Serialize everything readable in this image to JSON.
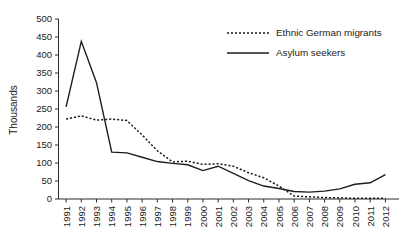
{
  "chart_data": {
    "type": "line",
    "title": "",
    "xlabel": "",
    "ylabel": "Thousands",
    "ylim": [
      0,
      500
    ],
    "ytick_step": 50,
    "yticks": [
      "0",
      "50",
      "100",
      "150",
      "200",
      "250",
      "300",
      "350",
      "400",
      "450",
      "500"
    ],
    "grid": false,
    "legend_position": "top-right",
    "categories": [
      "1991",
      "1992",
      "1993",
      "1994",
      "1995",
      "1996",
      "1997",
      "1998",
      "1999",
      "2000",
      "2001",
      "2002",
      "2003",
      "2004",
      "2005",
      "2006",
      "2007",
      "2008",
      "2009",
      "2010",
      "2011",
      "2012"
    ],
    "series": [
      {
        "name": "Ethnic German migrants",
        "style": "dotted",
        "values": [
          222,
          231,
          219,
          222,
          218,
          178,
          134,
          103,
          105,
          96,
          98,
          91,
          73,
          59,
          36,
          8,
          6,
          4,
          3,
          2,
          2,
          2
        ]
      },
      {
        "name": "Asylum seekers",
        "style": "solid",
        "values": [
          256,
          438,
          323,
          130,
          128,
          116,
          104,
          99,
          95,
          79,
          91,
          71,
          51,
          36,
          29,
          21,
          19,
          22,
          28,
          41,
          45,
          68
        ]
      }
    ]
  },
  "legend": {
    "entries": [
      {
        "label": "Ethnic German migrants",
        "style": "dotted"
      },
      {
        "label": "Asylum seekers",
        "style": "solid"
      }
    ]
  },
  "axes": {
    "y_axis_title": "Thousands"
  }
}
